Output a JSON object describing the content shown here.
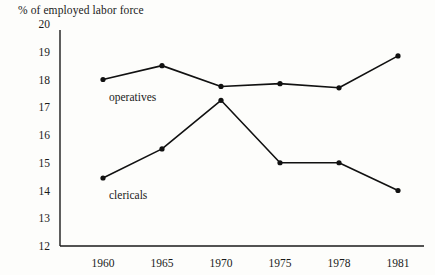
{
  "chart_data": {
    "type": "line",
    "title": "% of employed labor force",
    "xlabel": "",
    "ylabel": "",
    "categories": [
      "1960",
      "1965",
      "1970",
      "1975",
      "1978",
      "1981"
    ],
    "ylim": [
      12,
      20
    ],
    "yticks": [
      "12",
      "13",
      "14",
      "15",
      "16",
      "17",
      "18",
      "19",
      "20"
    ],
    "grid": false,
    "legend_position": "inline-annotations",
    "series": [
      {
        "name": "operatives",
        "color": "#111111",
        "values": [
          18.0,
          18.5,
          17.75,
          17.85,
          17.7,
          18.85
        ]
      },
      {
        "name": "clericals",
        "color": "#111111",
        "values": [
          14.45,
          15.5,
          17.25,
          15.0,
          15.0,
          14.0
        ]
      }
    ],
    "annotations": [
      {
        "text": "operatives",
        "series": "operatives"
      },
      {
        "text": "clericals",
        "series": "clericals"
      }
    ]
  }
}
